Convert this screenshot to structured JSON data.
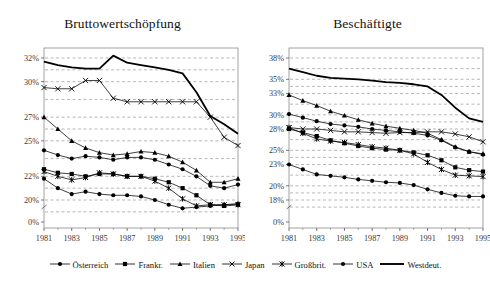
{
  "figure": {
    "width": 490,
    "height": 283,
    "background": "#ffffff",
    "line_color": "#000000",
    "grid_color": "#9a9a9a",
    "frame_color": "#8a8a8a"
  },
  "legend": {
    "position": "bottom-center",
    "items": [
      {
        "label": "Österreich",
        "marker": "circle-filled",
        "key_name": "legend-key-oesterreich"
      },
      {
        "label": "Frankr.",
        "marker": "square-filled",
        "key_name": "legend-key-frankr"
      },
      {
        "label": "Italien",
        "marker": "triangle-filled",
        "key_name": "legend-key-italien"
      },
      {
        "label": "Japan",
        "marker": "cross-x",
        "key_name": "legend-key-japan"
      },
      {
        "label": "Großbrit.",
        "marker": "asterisk",
        "key_name": "legend-key-grossbrit"
      },
      {
        "label": "USA",
        "marker": "circle-filled",
        "key_name": "legend-key-usa"
      },
      {
        "label": "Westdeut.",
        "marker": "line-thick",
        "key_name": "legend-key-westdeut"
      }
    ]
  },
  "chart_data": [
    {
      "id": "bruttowertschoepfung",
      "type": "line",
      "title": "Bruttowertschöpfung",
      "xlabel": "",
      "ylabel": "",
      "grid": true,
      "legend_position": "bottom",
      "x": [
        1981,
        1982,
        1983,
        1984,
        1985,
        1986,
        1987,
        1988,
        1989,
        1990,
        1991,
        1992,
        1993,
        1994,
        1995
      ],
      "xtick_labels": [
        "1981",
        "",
        "1983",
        "",
        "1985",
        "",
        "1987",
        "",
        "1989",
        "",
        "1991",
        "",
        "1993",
        "",
        "1995"
      ],
      "ytick_values": [
        0,
        20,
        22,
        25,
        27,
        30,
        32
      ],
      "ytick_labels": [
        "0%",
        "20%",
        "22%",
        "25%",
        "27%",
        "30%",
        "32%"
      ],
      "ylim": [
        0,
        33.5
      ],
      "series": [
        {
          "name": "Österreich",
          "marker": "circle-filled",
          "values": [
            24.2,
            23.8,
            23.5,
            23.7,
            23.6,
            23.4,
            23.6,
            23.6,
            23.4,
            23.0,
            22.6,
            22.0,
            21.2,
            21.0,
            21.3
          ]
        },
        {
          "name": "Frankr.",
          "marker": "square-filled",
          "values": [
            22.6,
            22.3,
            22.2,
            22.0,
            22.2,
            22.2,
            22.0,
            22.0,
            21.8,
            21.5,
            21.0,
            20.4,
            19.6,
            19.5,
            19.6
          ]
        },
        {
          "name": "Italien",
          "marker": "triangle-filled",
          "values": [
            27.0,
            26.0,
            25.0,
            24.4,
            24.0,
            23.8,
            23.9,
            24.1,
            24.0,
            23.7,
            23.2,
            22.5,
            21.5,
            21.5,
            21.8
          ]
        },
        {
          "name": "Japan",
          "marker": "cross-x",
          "values": [
            29.5,
            29.4,
            29.4,
            30.1,
            30.1,
            28.6,
            28.3,
            28.3,
            28.3,
            28.3,
            28.3,
            28.3,
            27.0,
            25.3,
            24.6
          ]
        },
        {
          "name": "Großbrit.",
          "marker": "asterisk",
          "values": [
            22.4,
            22.0,
            21.7,
            21.9,
            22.3,
            22.2,
            22.0,
            22.0,
            21.6,
            21.0,
            20.1,
            19.5,
            19.6,
            19.6,
            19.6
          ]
        },
        {
          "name": "USA",
          "marker": "circle-filled",
          "values": [
            21.8,
            21.0,
            20.5,
            20.7,
            20.5,
            20.4,
            20.4,
            20.3,
            20.0,
            19.6,
            19.3,
            19.4,
            19.5,
            19.6,
            19.7
          ]
        },
        {
          "name": "Westdeut.",
          "marker": "line-thick",
          "values": [
            31.7,
            31.4,
            31.2,
            31.1,
            31.1,
            32.2,
            31.6,
            31.4,
            31.2,
            31.0,
            30.7,
            29.1,
            27.1,
            26.4,
            25.6
          ]
        }
      ]
    },
    {
      "id": "beschaeftigte",
      "type": "line",
      "title": "Beschäftigte",
      "xlabel": "",
      "ylabel": "",
      "grid": true,
      "legend_position": "bottom",
      "x": [
        1981,
        1982,
        1983,
        1984,
        1985,
        1986,
        1987,
        1988,
        1989,
        1990,
        1991,
        1992,
        1993,
        1994,
        1995
      ],
      "xtick_labels": [
        "1981",
        "",
        "1983",
        "",
        "1985",
        "",
        "1987",
        "",
        "1989",
        "",
        "1991",
        "",
        "1993",
        "",
        "1995"
      ],
      "ytick_values": [
        0,
        18,
        20,
        23,
        25,
        28,
        30,
        33,
        35,
        38
      ],
      "ytick_labels": [
        "0%",
        "18%",
        "20%",
        "23%",
        "25%",
        "28%",
        "30%",
        "33%",
        "35%",
        "38%"
      ],
      "ylim": [
        0,
        39
      ],
      "series": [
        {
          "name": "Österreich",
          "marker": "circle-filled",
          "values": [
            30.1,
            29.6,
            29.1,
            28.7,
            28.5,
            28.3,
            28.0,
            27.8,
            27.6,
            27.4,
            27.1,
            26.4,
            25.4,
            24.8,
            24.4
          ]
        },
        {
          "name": "Frankr.",
          "marker": "square-filled",
          "values": [
            28.0,
            27.5,
            27.0,
            26.4,
            26.0,
            25.6,
            25.3,
            25.1,
            25.0,
            24.7,
            24.3,
            23.6,
            22.6,
            22.2,
            22.0
          ]
        },
        {
          "name": "Italien",
          "marker": "triangle-filled",
          "values": [
            32.8,
            32.0,
            31.3,
            30.5,
            29.9,
            29.3,
            28.8,
            28.4,
            28.1,
            27.8,
            27.4,
            26.5,
            25.5,
            24.8,
            24.5
          ]
        },
        {
          "name": "Japan",
          "marker": "cross-x",
          "values": [
            28.2,
            28.0,
            28.0,
            27.8,
            27.6,
            27.6,
            27.5,
            27.4,
            27.5,
            27.5,
            27.6,
            27.6,
            27.3,
            26.9,
            26.2
          ]
        },
        {
          "name": "Großbrit.",
          "marker": "asterisk",
          "values": [
            28.2,
            27.4,
            26.6,
            26.3,
            26.1,
            25.8,
            25.5,
            25.3,
            25.0,
            24.5,
            23.3,
            22.3,
            21.5,
            21.4,
            21.3
          ]
        },
        {
          "name": "USA",
          "marker": "circle-filled",
          "values": [
            23.0,
            22.3,
            21.6,
            21.4,
            21.2,
            20.9,
            20.7,
            20.5,
            20.4,
            20.1,
            19.5,
            19.0,
            18.6,
            18.5,
            18.5
          ]
        },
        {
          "name": "Westdeut.",
          "marker": "line-thick",
          "values": [
            36.5,
            36.0,
            35.5,
            35.2,
            35.1,
            35.0,
            34.8,
            34.6,
            34.5,
            34.3,
            34.0,
            32.8,
            31.0,
            29.5,
            29.0
          ]
        }
      ]
    }
  ]
}
